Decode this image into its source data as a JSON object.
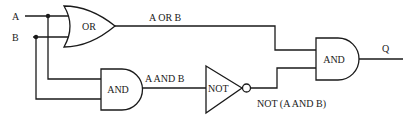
{
  "diagram": {
    "inputs": [
      {
        "id": "A",
        "label": "A"
      },
      {
        "id": "B",
        "label": "B"
      }
    ],
    "gates": [
      {
        "id": "or1",
        "type": "OR",
        "label": "OR",
        "inputs": [
          "A",
          "B"
        ]
      },
      {
        "id": "and1",
        "type": "AND",
        "label": "AND",
        "inputs": [
          "A",
          "B"
        ]
      },
      {
        "id": "not1",
        "type": "NOT",
        "label": "NOT",
        "inputs": [
          "and1"
        ]
      },
      {
        "id": "and2",
        "type": "AND",
        "label": "AND",
        "inputs": [
          "or1",
          "not1"
        ]
      }
    ],
    "wire_labels": {
      "or_out": "A OR B",
      "and_out": "A AND B",
      "not_out": "NOT (A AND B)"
    },
    "output": {
      "id": "Q",
      "label": "Q"
    },
    "colors": {
      "stroke": "#1a1a1a",
      "background": "#ffffff"
    }
  }
}
